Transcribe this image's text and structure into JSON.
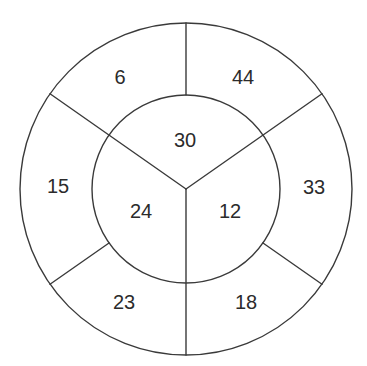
{
  "diagram": {
    "type": "bullseye-segment-diagram",
    "geometry": {
      "center": [
        186,
        189
      ],
      "outer_radius": 166,
      "inner_radius": 94,
      "line_color": "#3a3a3a",
      "text_color": "#2b2b2b"
    },
    "outer_ring": {
      "segments": [
        {
          "position": "top-left",
          "label": "6"
        },
        {
          "position": "top-right",
          "label": "44"
        },
        {
          "position": "right",
          "label": "33"
        },
        {
          "position": "bottom-right",
          "label": "18"
        },
        {
          "position": "bottom-left",
          "label": "23"
        },
        {
          "position": "left",
          "label": "15"
        }
      ]
    },
    "inner_circle": {
      "segments": [
        {
          "position": "top",
          "label": "30"
        },
        {
          "position": "lower-right",
          "label": "12"
        },
        {
          "position": "lower-left",
          "label": "24"
        }
      ]
    }
  }
}
